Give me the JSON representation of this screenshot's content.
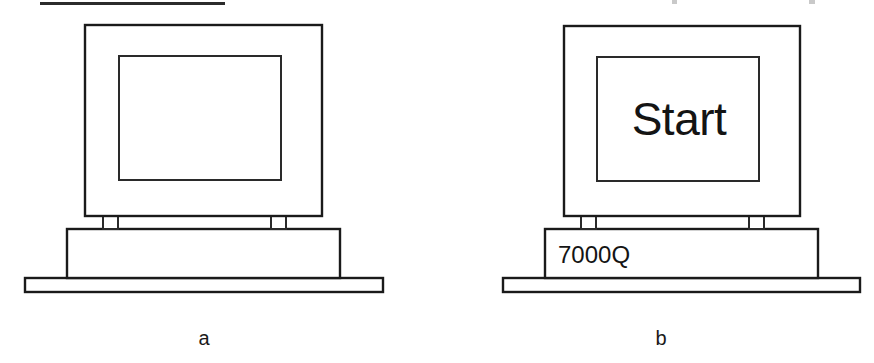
{
  "figure": {
    "background_color": "#ffffff",
    "line_color": "#1a1a1a",
    "width": 874,
    "height": 363
  },
  "artifacts": {
    "top_scan_bar": "scan-line-artifact"
  },
  "panels": [
    {
      "id": "panel-a",
      "caption": "a",
      "screen_text": "",
      "model_label": "",
      "icons": {
        "monitor": "crt-monitor-icon",
        "base": "computer-base-icon",
        "platform": "desk-platform-icon",
        "foot_left": "monitor-foot-left-icon",
        "foot_right": "monitor-foot-right-icon"
      }
    },
    {
      "id": "panel-b",
      "caption": "b",
      "screen_text": "Start",
      "model_label": "7000Q",
      "icons": {
        "monitor": "crt-monitor-icon",
        "base": "computer-base-icon",
        "platform": "desk-platform-icon",
        "foot_left": "monitor-foot-left-icon",
        "foot_right": "monitor-foot-right-icon"
      }
    }
  ]
}
